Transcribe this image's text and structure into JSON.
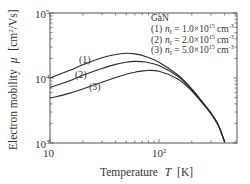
{
  "chart_data": {
    "type": "line",
    "title": "",
    "material_label": "GaN",
    "xlabel": "Temperature  T  [K]",
    "ylabel": "Electron mobility μ  [cm²/Vs]",
    "xscale": "log",
    "yscale": "log",
    "xlim": [
      10,
      520
    ],
    "ylim": [
      1000,
      100000
    ],
    "x_ticks": [
      {
        "value": 10,
        "label": "10"
      },
      {
        "value": 100,
        "label": "10²"
      }
    ],
    "y_ticks": [
      {
        "value": 1000,
        "label": "10³"
      },
      {
        "value": 10000,
        "label": "10⁴"
      },
      {
        "value": 100000,
        "label": "10⁵"
      }
    ],
    "grid": false,
    "legend_position": "upper right",
    "x": [
      10,
      15,
      20,
      30,
      40,
      50,
      60,
      75,
      100,
      150,
      200,
      250,
      300,
      350,
      400
    ],
    "series": [
      {
        "name": "(1) n_I = 1.0×10¹⁵ cm⁻³",
        "label": "(1)",
        "values": [
          10000,
          13000,
          16000,
          20500,
          23000,
          24000,
          23500,
          21500,
          17500,
          11000,
          6800,
          4300,
          2900,
          1900,
          1050
        ]
      },
      {
        "name": "(2) n_I = 2.0×10¹⁵ cm⁻³",
        "label": "(2)",
        "values": [
          7200,
          9000,
          11000,
          14000,
          16200,
          17500,
          18000,
          17600,
          15500,
          10500,
          6600,
          4200,
          2850,
          1880,
          1040
        ]
      },
      {
        "name": "(3) n_I = 5.0×10¹⁵ cm⁻³",
        "label": "(3)",
        "values": [
          4900,
          5800,
          6800,
          8600,
          10200,
          11400,
          12300,
          13000,
          12700,
          9600,
          6300,
          4100,
          2800,
          1850,
          1030
        ]
      }
    ]
  },
  "legend": {
    "title": "GaN",
    "items": [
      {
        "num": "(1)",
        "sym": "n",
        "sub": "I",
        "eq": " = 1.0×10",
        "exp": "15",
        "unit": " cm",
        "uexp": "-3"
      },
      {
        "num": "(2)",
        "sym": "n",
        "sub": "I",
        "eq": " = 2.0×10",
        "exp": "15",
        "unit": " cm",
        "uexp": "-3"
      },
      {
        "num": "(3)",
        "sym": "n",
        "sub": "I",
        "eq": " = 5.0×10",
        "exp": "15",
        "unit": " cm",
        "uexp": "-3"
      }
    ]
  },
  "axes": {
    "x_title": "Temperature",
    "x_var": "T",
    "x_unit": "[K]",
    "y_title": "Electron mobility",
    "y_var": "μ",
    "y_unit": "[cm²/Vs]"
  },
  "curve_labels": [
    "(1)",
    "(2)",
    "(3)"
  ],
  "colors": {
    "line": "#2a2a2a",
    "axis": "#555555",
    "text": "#333333"
  }
}
